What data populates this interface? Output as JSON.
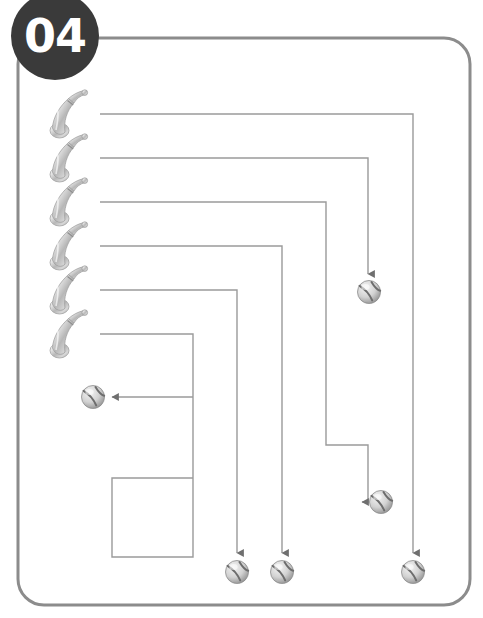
{
  "puzzle": {
    "badge_label": "04",
    "badge_color": "#3a3a3a",
    "frame_color": "#8c8c8c",
    "line_color": "#9a9a9a",
    "type": "maze-matching-puzzle",
    "theme": "baseball-bats-and-balls",
    "frame": {
      "x": 18,
      "y": 38,
      "width": 452,
      "height": 567,
      "radius": 26
    },
    "bats": [
      {
        "id": "bat-1",
        "x": 50,
        "y": 90,
        "line_start_x": 100,
        "line_start_y": 114
      },
      {
        "id": "bat-2",
        "x": 50,
        "y": 134,
        "line_start_x": 100,
        "line_start_y": 158
      },
      {
        "id": "bat-3",
        "x": 50,
        "y": 178,
        "line_start_x": 100,
        "line_start_y": 202
      },
      {
        "id": "bat-4",
        "x": 50,
        "y": 222,
        "line_start_x": 100,
        "line_start_y": 246
      },
      {
        "id": "bat-5",
        "x": 50,
        "y": 266,
        "line_start_x": 100,
        "line_start_y": 290
      },
      {
        "id": "bat-6",
        "x": 50,
        "y": 310,
        "line_start_x": 100,
        "line_start_y": 334
      }
    ],
    "balls": [
      {
        "id": "ball-top-right",
        "cx": 369,
        "cy": 292,
        "r": 12,
        "arrow": "down"
      },
      {
        "id": "ball-mid-left",
        "cx": 93,
        "cy": 397,
        "r": 12,
        "arrow": "left"
      },
      {
        "id": "ball-mid-right",
        "cx": 381,
        "cy": 502,
        "r": 12,
        "arrow": "right"
      },
      {
        "id": "ball-bottom-1",
        "cx": 237,
        "cy": 572,
        "r": 12,
        "arrow": "down"
      },
      {
        "id": "ball-bottom-2",
        "cx": 282,
        "cy": 572,
        "r": 12,
        "arrow": "down"
      },
      {
        "id": "ball-bottom-3",
        "cx": 413,
        "cy": 572,
        "r": 12,
        "arrow": "down"
      }
    ],
    "paths": [
      {
        "id": "path-bat-1",
        "from": "bat-1",
        "to": "ball-bottom-3",
        "d": "M 100 114 L 413 114 L 413 553"
      },
      {
        "id": "path-bat-2",
        "from": "bat-2",
        "to": "ball-top-right",
        "d": "M 100 158 L 368 158 L 368 274"
      },
      {
        "id": "path-bat-3",
        "from": "bat-3",
        "to": "ball-mid-right",
        "d": "M 100 202 L 326 202 L 326 445 L 368 445 L 368 502 L 362 502"
      },
      {
        "id": "path-bat-4",
        "from": "bat-4",
        "to": "ball-bottom-2",
        "d": "M 100 246 L 282 246 L 282 553"
      },
      {
        "id": "path-bat-5",
        "from": "bat-5",
        "to": "ball-bottom-1",
        "d": "M 100 290 L 237 290 L 237 553"
      },
      {
        "id": "path-bat-6",
        "from": "bat-6",
        "to": "ball-mid-left",
        "d": "M 100 334 L 193 334 L 193 478 L 112 478 L 112 557 L 193 557 L 193 397 L 112 397"
      }
    ]
  }
}
